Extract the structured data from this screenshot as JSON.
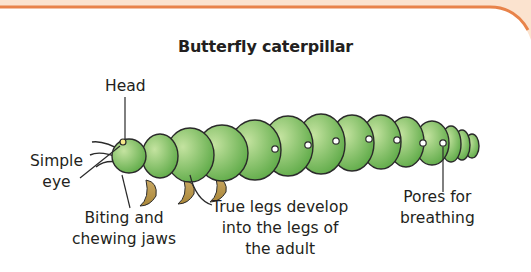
{
  "diagram": {
    "title": "Butterfly caterpillar",
    "labels": {
      "head": "Head",
      "simple_eye_1": "Simple",
      "simple_eye_2": "eye",
      "jaws_1": "Biting and",
      "jaws_2": "chewing jaws",
      "legs_1": "True legs develop",
      "legs_2": "into the legs of",
      "legs_3": "the adult",
      "pores_1": "Pores for",
      "pores_2": "breathing"
    },
    "colors": {
      "border": "#e8834a",
      "border_fill": "#fbe3cf",
      "body_light": "#b9dc92",
      "body_dark": "#5fae45",
      "legs": "#b7944a",
      "outline": "#2a2a2a"
    }
  }
}
